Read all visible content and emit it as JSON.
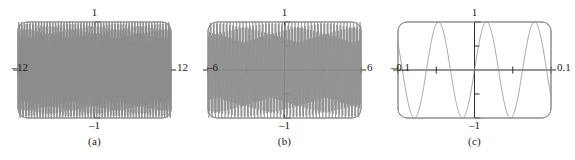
{
  "figure": {
    "title": "",
    "background": "#ffffff",
    "panel_count": 3,
    "curve_color": "#8c8c8c",
    "axis_color": "#2b2b2b",
    "frame_color": "#8f8f8f"
  },
  "panels": [
    {
      "caption": "(a)",
      "x_left_label": "‒12",
      "x_right_label": "12",
      "y_top_label": "1",
      "y_bottom_label": "‒1"
    },
    {
      "caption": "(b)",
      "x_left_label": "‒6",
      "x_right_label": "6",
      "y_top_label": "1",
      "y_bottom_label": "‒1"
    },
    {
      "caption": "(c)",
      "x_left_label": "‒0.1",
      "x_right_label": "0.1",
      "y_top_label": "1",
      "y_bottom_label": "‒1"
    }
  ],
  "chart_data": [
    {
      "type": "line",
      "title": "(a)",
      "xlabel": "",
      "ylabel": "",
      "xlim": [
        -12,
        12
      ],
      "ylim": [
        -1,
        1
      ],
      "xticks": [
        -12,
        -6,
        0,
        6,
        12
      ],
      "xtick_labels": [
        "‒12",
        "",
        "",
        "",
        "12"
      ],
      "yticks": [
        -1,
        -0.5,
        0,
        0.5,
        1
      ],
      "ytick_labels": [
        "‒1",
        "",
        "",
        "",
        "1"
      ],
      "grid": false,
      "legend": "none",
      "series": [
        {
          "name": "sin(100x)",
          "function": "sin(100*x)",
          "amplitude": 1,
          "frequency_rad_per_unit": 100,
          "sample_count": 1200,
          "note": "densely aliased sampling over the full window produces the dark band of vertical strokes"
        }
      ]
    },
    {
      "type": "line",
      "title": "(b)",
      "xlabel": "",
      "ylabel": "",
      "xlim": [
        -6,
        6
      ],
      "ylim": [
        -1,
        1
      ],
      "xticks": [
        -6,
        -3,
        0,
        3,
        6
      ],
      "xtick_labels": [
        "‒6",
        "",
        "",
        "",
        "6"
      ],
      "yticks": [
        -1,
        -0.5,
        0,
        0.5,
        1
      ],
      "ytick_labels": [
        "‒1",
        "",
        "",
        "",
        "1"
      ],
      "grid": false,
      "legend": "none",
      "series": [
        {
          "name": "sin(100x)",
          "function": "sin(100*x)",
          "amplitude": 1,
          "frequency_rad_per_unit": 100,
          "sample_count": 620,
          "note": "aliasing produces visible beat envelope with packets of strokes"
        }
      ]
    },
    {
      "type": "line",
      "title": "(c)",
      "xlabel": "",
      "ylabel": "",
      "xlim": [
        -0.1,
        0.1
      ],
      "ylim": [
        -1,
        1
      ],
      "xticks": [
        -0.1,
        -0.05,
        0,
        0.05,
        0.1
      ],
      "xtick_labels": [
        "‒0.1",
        "",
        "",
        "",
        "0.1"
      ],
      "yticks": [
        -1,
        -0.5,
        0,
        0.5,
        1
      ],
      "ytick_labels": [
        "‒1",
        "",
        "",
        "",
        "1"
      ],
      "grid": false,
      "legend": "none",
      "series": [
        {
          "name": "sin(100x)",
          "function": "sin(100*x)",
          "amplitude": 1,
          "frequency_rad_per_unit": 100,
          "sample_count": 400,
          "note": "fully resolved: about 3.2 complete sine cycles are visible"
        }
      ]
    }
  ]
}
